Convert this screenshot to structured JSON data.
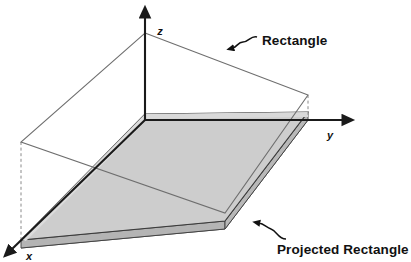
{
  "figure": {
    "kind": "3d-geometry-diagram",
    "background_color": "#ffffff",
    "width": 411,
    "height": 262
  },
  "axes": {
    "origin": {
      "x": 145,
      "y": 120
    },
    "items": [
      {
        "name": "z",
        "label": "z",
        "label_x": 160,
        "label_y": 35,
        "direction": "up",
        "from_x": 145,
        "from_y": 120,
        "to_x": 145,
        "to_y": 14,
        "color": "#1a1a1a"
      },
      {
        "name": "y",
        "label": "y",
        "label_x": 330,
        "label_y": 138,
        "direction": "right",
        "from_x": 145,
        "from_y": 120,
        "to_x": 349,
        "to_y": 120,
        "color": "#1a1a1a"
      },
      {
        "name": "x",
        "label": "x",
        "label_x": 28,
        "label_y": 259,
        "direction": "lower-left",
        "from_x": 145,
        "from_y": 120,
        "to_x": 6,
        "to_y": 255,
        "color": "#1a1a1a"
      }
    ]
  },
  "shapes": {
    "rectangle": {
      "label": "Rectangle",
      "stroke_color": "#6e6e6e",
      "fill_color": "none",
      "vertices": [
        {
          "x": 145,
          "y": 33
        },
        {
          "x": 308,
          "y": 95
        },
        {
          "x": 225,
          "y": 213
        },
        {
          "x": 21,
          "y": 142
        }
      ]
    },
    "projected_rectangle": {
      "label": "Projected Rectangle",
      "top_fill_color": "#cdcdcd",
      "side_fill_color": "#bcbcbc",
      "edge_fill_color": "#dcdcdc",
      "stroke_color": "#3c3c3c",
      "thickness_px": 8,
      "top_vertices": [
        {
          "x": 145,
          "y": 114
        },
        {
          "x": 308,
          "y": 112
        },
        {
          "x": 225,
          "y": 221
        },
        {
          "x": 21,
          "y": 240
        }
      ]
    },
    "drop_lines": [
      {
        "name": "left-drop-line",
        "from_x": 21,
        "from_y": 142,
        "to_x": 21,
        "to_y": 243,
        "style": "dashed",
        "color": "#8a8a8a"
      },
      {
        "name": "right-drop-line",
        "from_x": 308,
        "from_y": 95,
        "to_x": 308,
        "to_y": 116,
        "style": "dashed",
        "color": "#8a8a8a"
      },
      {
        "name": "origin-drop-line",
        "from_x": 145,
        "from_y": 33,
        "to_x": 145,
        "to_y": 120,
        "style": "dashed",
        "color": "#9a9a9a"
      }
    ]
  },
  "callouts": [
    {
      "name": "rectangle-callout",
      "label": "Rectangle",
      "text_x": 262,
      "text_y": 45,
      "arrow_tip_x": 231,
      "arrow_tip_y": 49,
      "arrow_tail_x": 258,
      "arrow_tail_y": 38,
      "color": "#111111"
    },
    {
      "name": "projected-rectangle-callout",
      "label": "Projected Rectangle",
      "text_x": 277,
      "text_y": 254,
      "arrow_tip_x": 255,
      "arrow_tip_y": 222,
      "arrow_tail_x": 283,
      "arrow_tail_y": 238,
      "color": "#111111"
    }
  ]
}
